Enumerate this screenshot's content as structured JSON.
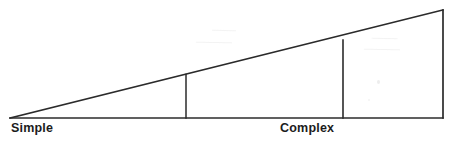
{
  "figure": {
    "kind": "triangle-continuum-diagram",
    "width": 459,
    "height": 145,
    "background_color": "#ffffff",
    "stroke_color": "#2b2b2b",
    "stroke_width": 1.5,
    "text_color": "#1c1c1c"
  },
  "labels": {
    "left_label": "Simple",
    "right_label": "Complex"
  },
  "geometry": {
    "apex": {
      "x": 10,
      "y": 118
    },
    "base_right": {
      "x": 443,
      "y": 118
    },
    "top_right": {
      "x": 443,
      "y": 10
    },
    "baseline_y": 118,
    "dividers": [
      {
        "name": "divider-1",
        "x": 186,
        "y_top": 76,
        "y_bottom": 118
      },
      {
        "name": "divider-2",
        "x": 343,
        "y_top": 41,
        "y_bottom": 118
      }
    ],
    "segments": [
      {
        "name": "segment-simple",
        "x_start": 10,
        "x_end": 186
      },
      {
        "name": "segment-middle",
        "x_start": 186,
        "x_end": 343
      },
      {
        "name": "segment-complex",
        "x_start": 343,
        "x_end": 443
      }
    ]
  },
  "artifacts": {
    "description": "faint scanner bleed-through from reverse page side, illegible",
    "marks": [
      {
        "name": "bleed-upper-a",
        "text": "———"
      },
      {
        "name": "bleed-upper-b",
        "text": "————"
      },
      {
        "name": "bleed-right-a",
        "text": "———"
      },
      {
        "name": "bleed-right-b",
        "text": "————"
      }
    ]
  }
}
